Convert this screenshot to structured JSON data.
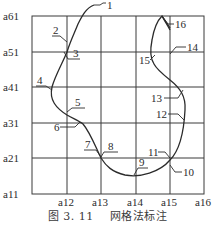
{
  "figure": {
    "caption_number": "图 3. 11",
    "caption_title": "网格法标注"
  },
  "grid": {
    "row_labels": [
      "a61",
      "a51",
      "a41",
      "a31",
      "a21",
      "a11"
    ],
    "column_labels": [
      "a12",
      "a13",
      "a14",
      "a15",
      "a16"
    ]
  },
  "callouts": [
    {
      "id": "1",
      "label": "1"
    },
    {
      "id": "2",
      "label": "2"
    },
    {
      "id": "3",
      "label": "3"
    },
    {
      "id": "4",
      "label": "4"
    },
    {
      "id": "5",
      "label": "5"
    },
    {
      "id": "6",
      "label": "6"
    },
    {
      "id": "7",
      "label": "7"
    },
    {
      "id": "8",
      "label": "8"
    },
    {
      "id": "9",
      "label": "9"
    },
    {
      "id": "10",
      "label": "10"
    },
    {
      "id": "11",
      "label": "11"
    },
    {
      "id": "12",
      "label": "12"
    },
    {
      "id": "13",
      "label": "13"
    },
    {
      "id": "14",
      "label": "14"
    },
    {
      "id": "15",
      "label": "15"
    },
    {
      "id": "16",
      "label": "16"
    }
  ],
  "colors": {
    "line": "#2b2b2b",
    "background": "#ffffff"
  }
}
